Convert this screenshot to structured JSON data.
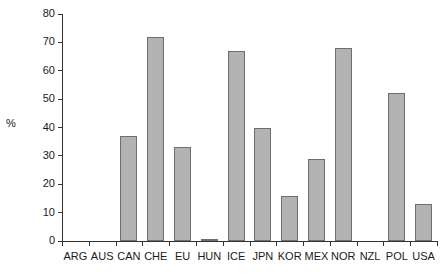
{
  "chart_data": {
    "type": "bar",
    "title": "",
    "subtitle": "",
    "xlabel": "",
    "ylabel": "%",
    "ylim": [
      0,
      80
    ],
    "ytick_step": 10,
    "yticks": [
      0,
      10,
      20,
      30,
      40,
      50,
      60,
      70,
      80
    ],
    "ytick_labels": [
      "0",
      "10",
      "20",
      "30",
      "40",
      "50",
      "60",
      "70",
      "80"
    ],
    "grid": false,
    "legend": null,
    "legend_position": "none",
    "categories": [
      "ARG",
      "AUS",
      "CAN",
      "CHE",
      "EU",
      "HUN",
      "ICE",
      "JPN",
      "KOR",
      "MEX",
      "NOR",
      "NZL",
      "POL",
      "USA"
    ],
    "values": [
      0,
      0,
      37,
      72,
      33,
      0.5,
      67,
      40,
      16,
      29,
      68,
      0,
      52,
      13
    ],
    "bar_color": "#b3b3b3",
    "bar_edge_color": "#6e6e6e",
    "axis_color": "#333333"
  }
}
